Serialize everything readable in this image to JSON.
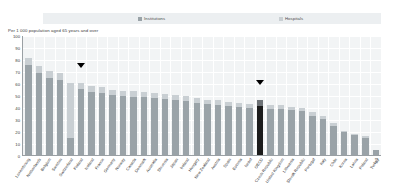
{
  "legend": {
    "items": [
      {
        "label": "Institutions",
        "color": "#9aa3a8",
        "key": "institutions"
      },
      {
        "label": "Hospitals",
        "color": "#c9cfd3",
        "key": "hospitals"
      }
    ]
  },
  "subtitle": "Per 1 000 population aged 65 years and over",
  "chart_data": {
    "type": "bar",
    "stacked": true,
    "title": "",
    "subtitle": "Per 1 000 population aged 65 years and over",
    "xlabel": "",
    "ylabel": "Per 1 000 population aged 65 years and over",
    "ylim": [
      0,
      100
    ],
    "yticks": [
      100,
      90,
      80,
      70,
      60,
      50,
      40,
      30,
      20,
      10,
      0
    ],
    "grid": true,
    "legend_position": "top",
    "highlight_category": "OECD",
    "highlight_color": "#1c1c1c",
    "markers": [
      {
        "category": "Finland",
        "symbol": "triangle-down"
      },
      {
        "category": "OECD",
        "symbol": "triangle-down"
      }
    ],
    "categories": [
      "Luxembourg",
      "Netherlands",
      "Belgium",
      "Sweden",
      "Switzerland",
      "Finland",
      "Iceland",
      "France",
      "Germany",
      "Norway",
      "Canada",
      "Denmark",
      "Australia",
      "Slovenia",
      "Japan",
      "Ireland",
      "Hungary",
      "New Zealand",
      "Austria",
      "Spain",
      "Estonia",
      "Israel",
      "OECD",
      "Czech Republic",
      "United Kingdom",
      "Lithuania",
      "Slovak Republic",
      "Portugal",
      "Italy",
      "Chile",
      "Korea",
      "Latvia",
      "Poland",
      "Turkey"
    ],
    "series": [
      {
        "name": "Institutions",
        "color": "#9aa3a8",
        "values": [
          74.8,
          68.4,
          63.9,
          62.4,
          14.2,
          55.1,
          52.8,
          51.6,
          49.8,
          48.9,
          48.6,
          48.2,
          47.4,
          46.8,
          45.9,
          44.8,
          43.5,
          42.4,
          41.5,
          40.8,
          40.1,
          39.4,
          41.2,
          38.6,
          38.0,
          37.1,
          36.5,
          32.9,
          29.6,
          24.3,
          18.8,
          16.4,
          13.9,
          3.9
        ]
      },
      {
        "name": "Hospitals",
        "color": "#c9cfd3",
        "values": [
          6.0,
          5.6,
          5.8,
          5.7,
          45.6,
          5.3,
          4.4,
          4.9,
          4.5,
          4.3,
          4.6,
          4.0,
          4.1,
          4.0,
          4.1,
          4.0,
          4.0,
          3.8,
          4.3,
          3.8,
          3.5,
          3.4,
          4.4,
          3.4,
          3.3,
          2.9,
          2.8,
          2.8,
          2.7,
          2.1,
          1.6,
          1.5,
          1.6,
          0.4
        ]
      }
    ],
    "totals": [
      80.8,
      74.0,
      69.7,
      68.1,
      59.8,
      60.4,
      57.2,
      56.5,
      54.3,
      53.2,
      53.2,
      52.2,
      51.5,
      50.8,
      50.0,
      48.8,
      47.5,
      46.2,
      45.8,
      44.6,
      43.6,
      42.8,
      45.6,
      42.0,
      41.3,
      40.0,
      39.3,
      35.7,
      32.3,
      26.4,
      20.4,
      17.9,
      15.5,
      4.3
    ],
    "value_labels": [
      "80.8",
      "74.0",
      "69.7",
      "68.1",
      "59.8",
      "60.4",
      "57.2",
      "56.5",
      "54.3",
      "53.2",
      "53.2",
      "52.2",
      "51.5",
      "50.8",
      "50.0",
      "48.8",
      "47.5",
      "46.2",
      "45.8",
      "44.6",
      "43.6",
      "42.8",
      "45.6",
      "42.0",
      "41.3",
      "40.0",
      "39.3",
      "35.7",
      "32.3",
      "26.4",
      "20.4",
      "17.9",
      "15.5",
      "4.3"
    ]
  }
}
